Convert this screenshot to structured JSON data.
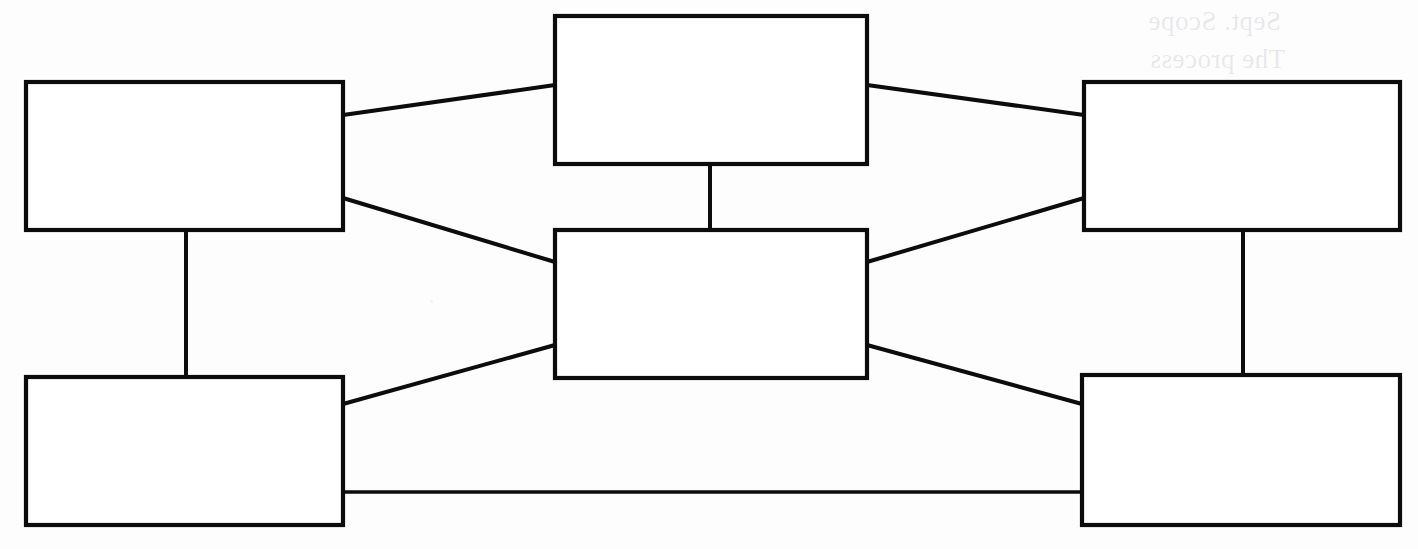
{
  "document": {
    "title": "Blank Concept Map Diagram",
    "media": "scanned-worksheet",
    "background_color": "#fdfdfd",
    "ink_color": "#0c0c0c",
    "width": 1418,
    "height": 549
  },
  "diagram": {
    "type": "node-link concept map",
    "node_count": 6,
    "edge_count": 10,
    "nodes": [
      {
        "id": "top-left",
        "label": "",
        "x": 26,
        "y": 82,
        "width": 317,
        "height": 148
      },
      {
        "id": "bottom-left",
        "label": "",
        "x": 26,
        "y": 377,
        "width": 317,
        "height": 148
      },
      {
        "id": "top-center",
        "label": "",
        "x": 555,
        "y": 16,
        "width": 312,
        "height": 148
      },
      {
        "id": "center",
        "label": "",
        "x": 555,
        "y": 230,
        "width": 312,
        "height": 148
      },
      {
        "id": "top-right",
        "label": "",
        "x": 1084,
        "y": 82,
        "width": 316,
        "height": 148
      },
      {
        "id": "bottom-right",
        "label": "",
        "x": 1082,
        "y": 375,
        "width": 318,
        "height": 150
      }
    ],
    "edges": [
      {
        "id": "edge-topleft-topcenter",
        "from": "top-left",
        "to": "top-center",
        "kind": "diagonal",
        "x1": 343,
        "y1": 115,
        "x2": 555,
        "y2": 85
      },
      {
        "id": "edge-topleft-center",
        "from": "top-left",
        "to": "center",
        "kind": "diagonal",
        "x1": 343,
        "y1": 198,
        "x2": 555,
        "y2": 262
      },
      {
        "id": "edge-topleft-bottomleft",
        "from": "top-left",
        "to": "bottom-left",
        "kind": "vertical",
        "x1": 186,
        "y1": 230,
        "x2": 186,
        "y2": 377
      },
      {
        "id": "edge-bottomleft-center",
        "from": "bottom-left",
        "to": "center",
        "kind": "diagonal",
        "x1": 343,
        "y1": 404,
        "x2": 555,
        "y2": 345
      },
      {
        "id": "edge-bottomleft-bottomright",
        "from": "bottom-left",
        "to": "bottom-right",
        "kind": "horizontal",
        "x1": 343,
        "y1": 492,
        "x2": 1082,
        "y2": 492
      },
      {
        "id": "edge-topcenter-center",
        "from": "top-center",
        "to": "center",
        "kind": "vertical",
        "x1": 710,
        "y1": 164,
        "x2": 710,
        "y2": 230
      },
      {
        "id": "edge-topcenter-topright",
        "from": "top-center",
        "to": "top-right",
        "kind": "diagonal",
        "x1": 867,
        "y1": 85,
        "x2": 1084,
        "y2": 115
      },
      {
        "id": "edge-center-topright",
        "from": "center",
        "to": "top-right",
        "kind": "diagonal",
        "x1": 867,
        "y1": 262,
        "x2": 1084,
        "y2": 198
      },
      {
        "id": "edge-center-bottomright",
        "from": "center",
        "to": "bottom-right",
        "kind": "diagonal",
        "x1": 867,
        "y1": 345,
        "x2": 1082,
        "y2": 404
      },
      {
        "id": "edge-topright-bottomright",
        "from": "top-right",
        "to": "bottom-right",
        "kind": "vertical",
        "x1": 1243,
        "y1": 230,
        "x2": 1243,
        "y2": 375
      }
    ]
  },
  "artifacts": {
    "ghost_text_note": "faint show-through from the reverse side of the page",
    "ghost_lines": [
      {
        "id": "ghost-line-1",
        "text": "Sept.   Scope",
        "x": 1148,
        "y": 6
      },
      {
        "id": "ghost-line-2",
        "text": "The  process",
        "x": 1150,
        "y": 44
      }
    ]
  }
}
